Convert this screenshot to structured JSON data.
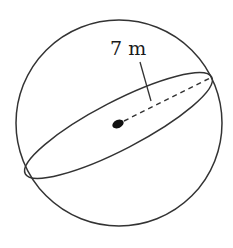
{
  "diagram": {
    "type": "sphere",
    "radius_label": "7 m",
    "elements": {
      "outer_circle": "sphere outline",
      "cross_section": "tilted ellipse (great circle)",
      "center_point": "filled dot at center",
      "radius_line": "dashed segment from center to edge of ellipse",
      "leader_line": "line connecting label to radius"
    },
    "colors": {
      "stroke": "#333333",
      "background": "#ffffff"
    }
  }
}
